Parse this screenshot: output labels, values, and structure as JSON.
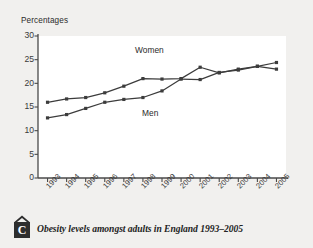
{
  "figure": {
    "caption_badge_letter": "C",
    "caption_text": "Obesity levels amongst adults in England 1993–2005",
    "badge_icon": "house-roof-icon",
    "background_color": "#f1f0ee",
    "plot_background_color": "#ffffff",
    "axis_color": "#4a4a4a",
    "series_color": "#3c3c3c"
  },
  "chart_data": {
    "type": "line",
    "title": "",
    "subtitle": "",
    "xlabel": "",
    "ylabel": "Percentages",
    "ylim": [
      0,
      30
    ],
    "yticks": [
      0,
      5,
      10,
      15,
      20,
      25,
      30
    ],
    "grid": false,
    "legend_position": "inline-annotation",
    "categories": [
      "1993",
      "1994",
      "1995",
      "1996",
      "1997",
      "1998",
      "1999",
      "2000",
      "2001",
      "2002",
      "2003",
      "2004",
      "2005"
    ],
    "series": [
      {
        "name": "Women",
        "label_position": "above-line",
        "values": [
          16.0,
          16.7,
          17.0,
          18.0,
          19.4,
          21.0,
          20.9,
          21.0,
          23.4,
          22.2,
          23.0,
          23.6,
          24.4
        ]
      },
      {
        "name": "Men",
        "label_position": "below-line",
        "values": [
          12.7,
          13.4,
          14.7,
          16.0,
          16.6,
          17.0,
          18.4,
          20.9,
          20.8,
          22.3,
          22.8,
          23.6,
          23.0
        ]
      }
    ],
    "annotations": [
      {
        "text": "Women",
        "x": "1998",
        "y": 26.5
      },
      {
        "text": "Men",
        "x": "1999",
        "y": 14.5
      }
    ]
  }
}
